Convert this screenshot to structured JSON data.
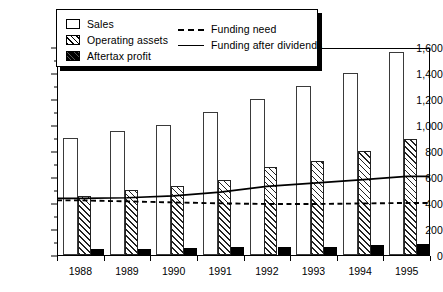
{
  "chart_data": {
    "type": "bar",
    "title": "",
    "xlabel": "",
    "ylabel": "",
    "ylim": [
      0,
      1600
    ],
    "ytick_step": 200,
    "grid": false,
    "legend_position": "top-left",
    "categories": [
      "1988",
      "1989",
      "1990",
      "1991",
      "1992",
      "1993",
      "1994",
      "1995"
    ],
    "ytick_labels": [
      "0",
      "200",
      "400",
      "600",
      "800",
      "1,000",
      "1,200",
      "1,400",
      "1,600"
    ],
    "ytick_values": [
      0,
      200,
      400,
      600,
      800,
      1000,
      1200,
      1400,
      1600
    ],
    "series": [
      {
        "name": "Sales",
        "kind": "bar",
        "style": "open",
        "values": [
          900,
          950,
          1000,
          1100,
          1200,
          1300,
          1400,
          1560
        ]
      },
      {
        "name": "Operating assets",
        "kind": "bar",
        "style": "hatched",
        "values": [
          450,
          500,
          530,
          575,
          670,
          720,
          800,
          890
        ]
      },
      {
        "name": "Aftertax profit",
        "kind": "bar",
        "style": "solid-black",
        "values": [
          42,
          45,
          50,
          55,
          62,
          62,
          72,
          78
        ]
      },
      {
        "name": "Funding need",
        "kind": "line",
        "style": "dashed",
        "values": [
          428,
          420,
          412,
          405,
          400,
          400,
          404,
          408
        ]
      },
      {
        "name": "Funding after dividends",
        "kind": "line",
        "style": "solid",
        "values": [
          443,
          448,
          462,
          492,
          535,
          560,
          585,
          612
        ]
      }
    ]
  },
  "legend": {
    "items_left": [
      {
        "label": "Sales",
        "swatch": "open-square-icon"
      },
      {
        "label": "Operating assets",
        "swatch": "hatched-square-icon"
      },
      {
        "label": "Aftertax profit",
        "swatch": "filled-square-icon"
      }
    ],
    "items_right": [
      {
        "label": "Funding need",
        "swatch": "dashed-line-icon"
      },
      {
        "label": "Funding after dividends",
        "swatch": "solid-line-icon"
      }
    ]
  },
  "colors": {
    "axis": "#000000",
    "bar_sales_fill": "#ffffff",
    "bar_sales_stroke": "#3a3a3a",
    "bar_assets_hatch": "#222222",
    "bar_profit_fill": "#000000",
    "line_funding_need": "#000000",
    "line_funding_after_dividends": "#000000",
    "background": "#ffffff"
  }
}
